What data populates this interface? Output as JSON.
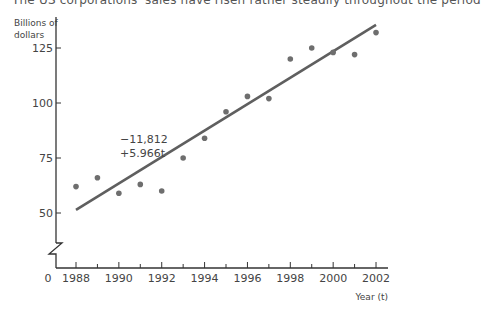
{
  "page": {
    "cut_off_text": "The US corporations' sales have risen rather steadily throughout the period"
  },
  "chart_data": {
    "type": "scatter",
    "title": "",
    "xlabel": "Year (t)",
    "ylabel": "Billions of dollars",
    "ylabel_lines": [
      "Billions of",
      "dollars"
    ],
    "x_origin_label": "0",
    "x_ticks": [
      "1988",
      "1990",
      "1992",
      "1994",
      "1996",
      "1998",
      "2000",
      "2002"
    ],
    "y_ticks": [
      "50",
      "75",
      "100",
      "125"
    ],
    "xlim": [
      1988,
      2002
    ],
    "ylim": [
      40,
      140
    ],
    "y_axis_break": true,
    "grid": false,
    "series": [
      {
        "name": "Sales",
        "x": [
          1988,
          1989,
          1990,
          1991,
          1992,
          1993,
          1994,
          1995,
          1996,
          1997,
          1998,
          1999,
          2000,
          2001,
          2002
        ],
        "values": [
          62,
          66,
          59,
          63,
          60,
          75,
          84,
          96,
          103,
          102,
          120,
          125,
          123,
          122,
          132
        ]
      }
    ],
    "trend_line": {
      "label_line1": "−11,812",
      "label_line2": "+5.966t",
      "equation": "y = −11,812 + 5.966t",
      "start": [
        1988,
        51.4
      ],
      "end": [
        2002,
        135.5
      ]
    },
    "colors": {
      "points": "#6e6e6e",
      "line": "#5f5f5f",
      "axis": "#333333"
    }
  }
}
